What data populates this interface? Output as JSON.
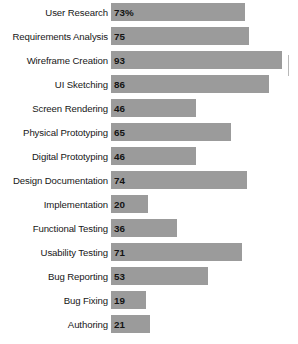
{
  "chart_data": {
    "type": "bar",
    "orientation": "horizontal",
    "title": "",
    "subtitle": "",
    "xlabel": "",
    "ylabel": "",
    "grid": false,
    "legend": null,
    "xlim": [
      0,
      100
    ],
    "bar_color": "#9b9b9b",
    "background_color": "#ffffff",
    "categories": [
      "User Research",
      "Requirements Analysis",
      "Wireframe Creation",
      "UI Sketching",
      "Screen Rendering",
      "Physical Prototyping",
      "Digital Prototyping",
      "Design Documentation",
      "Implementation",
      "Functional Testing",
      "Usability Testing",
      "Bug Reporting",
      "Bug Fixing",
      "Authoring"
    ],
    "values": [
      73,
      75,
      93,
      86,
      46,
      65,
      46,
      74,
      20,
      36,
      71,
      53,
      19,
      21
    ],
    "data_labels": [
      "73%",
      "75",
      "93",
      "86",
      "46",
      "65",
      "46",
      "74",
      "20",
      "36",
      "71",
      "53",
      "19",
      "21"
    ]
  },
  "rows": [
    {
      "label": "User Research",
      "value": 73,
      "display": "73%"
    },
    {
      "label": "Requirements Analysis",
      "value": 75,
      "display": "75"
    },
    {
      "label": "Wireframe Creation",
      "value": 93,
      "display": "93"
    },
    {
      "label": "UI Sketching",
      "value": 86,
      "display": "86"
    },
    {
      "label": "Screen Rendering",
      "value": 46,
      "display": "46"
    },
    {
      "label": "Physical Prototyping",
      "value": 65,
      "display": "65"
    },
    {
      "label": "Digital Prototyping",
      "value": 46,
      "display": "46"
    },
    {
      "label": "Design Documentation",
      "value": 74,
      "display": "74"
    },
    {
      "label": "Implementation",
      "value": 20,
      "display": "20"
    },
    {
      "label": "Functional Testing",
      "value": 36,
      "display": "36"
    },
    {
      "label": "Usability Testing",
      "value": 71,
      "display": "71"
    },
    {
      "label": "Bug Reporting",
      "value": 53,
      "display": "53"
    },
    {
      "label": "Bug Fixing",
      "value": 19,
      "display": "19"
    },
    {
      "label": "Authoring",
      "value": 21,
      "display": "21"
    }
  ]
}
